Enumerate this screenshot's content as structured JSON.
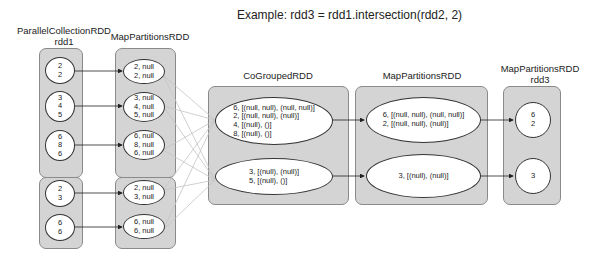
{
  "title": "Example: rdd3 = rdd1.intersection(rdd2, 2)",
  "columns": {
    "parallel_rdd1": {
      "label_line1": "ParallelCollectionRDD",
      "label_line2": "rdd1"
    },
    "parallel_rdd2": {
      "label": "rdd2"
    },
    "map1": {
      "label": "MapPartitionsRDD"
    },
    "cogrouped": {
      "label": "CoGroupedRDD"
    },
    "map2": {
      "label": "MapPartitionsRDD"
    },
    "rdd3": {
      "label_line1": "MapPartitionsRDD",
      "label_line2": "rdd3"
    }
  },
  "rdd1": {
    "partitions": [
      "2\n2",
      "3\n4\n5",
      "6\n8\n6"
    ]
  },
  "rdd2": {
    "partitions": [
      "2\n3",
      "6\n6"
    ]
  },
  "map1_top": {
    "partitions": [
      "2, null\n2, null",
      "3, null\n4, null\n5, null",
      "6, null\n8, null\n6, null"
    ]
  },
  "map1_bottom": {
    "partitions": [
      "2, null\n3, null",
      "6, null\n6, null"
    ]
  },
  "cogrouped": {
    "partitions": [
      "6, [(null, null), (null, null)]\n2, [(null, null), (null)]\n4, [(null), ()]\n8, [(null), ()]",
      "3, [(null), (null)]\n5, [(null), ()]"
    ]
  },
  "map2": {
    "partitions": [
      "6, [(null, null), (null, null)]\n2, [(null, null), (null)]",
      "3, [(null), (null)]"
    ]
  },
  "rdd3": {
    "partitions": [
      "6\n2",
      "3"
    ]
  },
  "colors": {
    "box_fill": "#d4d4d4",
    "box_border": "#8a8a8a",
    "ellipse_fill": "#ffffff",
    "arrow": "#222222",
    "shuffle_line": "#c4c4c4"
  }
}
